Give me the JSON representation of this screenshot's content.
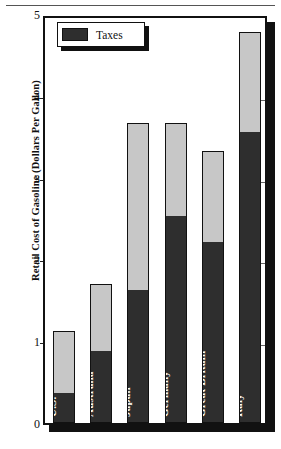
{
  "chart_data": {
    "type": "bar",
    "title": "",
    "subtitle": "",
    "xlabel": "",
    "ylabel": "Retail Cost of Gasoline (Dollars Per Gallon)",
    "categories": [
      "U.S.",
      "Australia",
      "Japan",
      "Germany",
      "Great Britain",
      "Italy"
    ],
    "series": [
      {
        "name": "Taxes",
        "values": [
          0.35,
          0.87,
          1.61,
          2.52,
          2.2,
          3.55
        ]
      },
      {
        "name": "Base Cost",
        "values": [
          0.78,
          0.83,
          2.06,
          1.15,
          1.13,
          1.23
        ]
      }
    ],
    "totals": [
      1.13,
      1.7,
      3.67,
      3.67,
      3.33,
      4.78
    ],
    "stacked": true,
    "ylim": [
      0,
      5
    ],
    "ytick_labels": [
      "0",
      "1",
      "2",
      "3",
      "4",
      "5"
    ],
    "ytick_values": [
      0,
      1,
      2,
      3,
      4,
      5
    ],
    "grid": false,
    "legend": {
      "position": "top-left",
      "entries": [
        "Taxes"
      ]
    },
    "colors": {
      "taxes": "#2e2e2e",
      "base": "#c7c7c7",
      "frame": "#111111",
      "background": "#ffffff"
    }
  },
  "axis": {
    "y_title": "Retail Cost of Gasoline (Dollars Per Gallon)",
    "ticks": [
      {
        "label": "5",
        "value": 5
      },
      {
        "label": "4",
        "value": 4
      },
      {
        "label": "3",
        "value": 3
      },
      {
        "label": "2",
        "value": 2
      },
      {
        "label": "1",
        "value": 1
      },
      {
        "label": "0",
        "value": 0
      }
    ]
  },
  "legend": {
    "label": "Taxes"
  },
  "bars": [
    {
      "label": "U.S.",
      "total": 1.13,
      "tax": 0.35
    },
    {
      "label": "Australia",
      "total": 1.7,
      "tax": 0.87
    },
    {
      "label": "Japan",
      "total": 3.67,
      "tax": 1.61
    },
    {
      "label": "Germany",
      "total": 3.67,
      "tax": 2.52
    },
    {
      "label": "Great Britain",
      "total": 3.33,
      "tax": 2.2
    },
    {
      "label": "Italy",
      "total": 4.78,
      "tax": 3.55
    }
  ]
}
